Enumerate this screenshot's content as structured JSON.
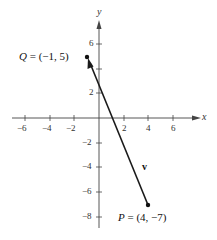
{
  "diagram": {
    "type": "vector-plot",
    "axes": {
      "x_label": "x",
      "y_label": "y",
      "x_ticks": [
        {
          "value": -6,
          "label": "−6"
        },
        {
          "value": -4,
          "label": "−4"
        },
        {
          "value": -2,
          "label": "−2"
        },
        {
          "value": 2,
          "label": "2"
        },
        {
          "value": 4,
          "label": "4"
        },
        {
          "value": 6,
          "label": "6"
        }
      ],
      "y_ticks": [
        {
          "value": 6,
          "label": "6"
        },
        {
          "value": 2,
          "label": "2"
        },
        {
          "value": -2,
          "label": "−2"
        },
        {
          "value": -4,
          "label": "−4"
        },
        {
          "value": -6,
          "label": "−6"
        },
        {
          "value": -8,
          "label": "−8"
        }
      ]
    },
    "points": {
      "Q": {
        "name": "Q",
        "label": "= (−1,  5)",
        "x": -1,
        "y": 5
      },
      "P": {
        "name": "P",
        "label": "= (4,  −7)",
        "x": 4,
        "y": -7
      }
    },
    "vector": {
      "name": "v",
      "from": "P",
      "to": "Q",
      "color": "#1a1a1a"
    }
  }
}
